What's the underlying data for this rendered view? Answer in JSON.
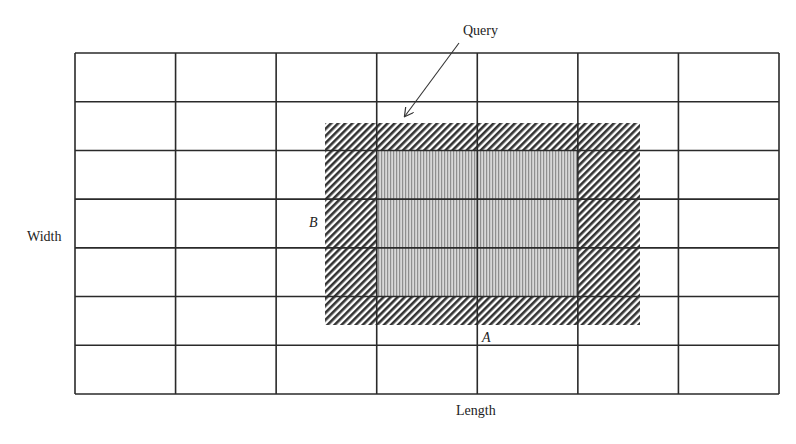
{
  "diagram": {
    "type": "spatial-grid-query",
    "grid": {
      "columns": 7,
      "rows": 7,
      "left": 75,
      "top": 53,
      "right": 779,
      "bottom": 394,
      "line_color": "#2a2a2a"
    },
    "query_region": {
      "label": "Query",
      "outer_box": {
        "x1": 325,
        "y1": 123,
        "x2": 640,
        "y2": 325
      },
      "outer_fill": "diagonal-hatch",
      "inner_cells": {
        "col_start": 3,
        "col_end": 5,
        "row_start": 2,
        "row_end": 5
      },
      "inner_fill": "vertical-stripes",
      "inner_color": "#a8a8a8",
      "hatch_color": "#333333"
    },
    "arrow": {
      "from": [
        459,
        43
      ],
      "to": [
        405,
        116
      ]
    }
  },
  "labels": {
    "query": "Query",
    "width_axis": "Width",
    "length_axis": "Length",
    "point_a": "A",
    "point_b": "B"
  }
}
